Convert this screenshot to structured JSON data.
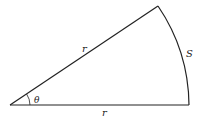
{
  "diagram": {
    "labels": {
      "upper_radius": "r",
      "lower_radius": "r",
      "angle": "θ",
      "arc": "S"
    },
    "geometry": {
      "vertex": [
        10,
        105
      ],
      "radius": 179,
      "top_point": [
        158,
        6
      ],
      "arc_end": [
        189,
        105
      ]
    },
    "colors": {
      "stroke": "#222222",
      "background": "#ffffff"
    }
  }
}
